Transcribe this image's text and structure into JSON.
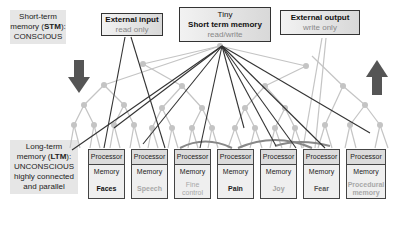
{
  "stm_label": {
    "line1": "Short-term",
    "line2a": "memory (",
    "line2b": "STM",
    "line2c": "):",
    "line3": "CONSCIOUS"
  },
  "ltm_label": {
    "line1": "Long-term",
    "line2a": "memory (",
    "line2b": "LTM",
    "line2c": "):",
    "line3": "UNCONSCIOUS",
    "line4": "highly connected",
    "line5": "and parallel"
  },
  "external_input": {
    "title": "External input",
    "subtitle": "read only"
  },
  "short_term_memory": {
    "title1": "Tiny",
    "title2": "Short term memory",
    "subtitle": "read/write"
  },
  "external_output": {
    "title": "External output",
    "subtitle": "write only"
  },
  "modules": [
    {
      "processor": "Processor",
      "memory": "Memory",
      "name": "Faces",
      "color": "#111111"
    },
    {
      "processor": "Processor",
      "memory": "Memory",
      "name": "Speech",
      "color": "#a8a8a8"
    },
    {
      "processor": "Processor",
      "memory": "Memory",
      "name": "Fine control",
      "color": "#a8a8a8"
    },
    {
      "processor": "Processor",
      "memory": "Memory",
      "name": "Pain",
      "color": "#222222"
    },
    {
      "processor": "Processor",
      "memory": "Memory",
      "name": "Joy",
      "color": "#a0a0a0"
    },
    {
      "processor": "Processor",
      "memory": "Memory",
      "name": "Fear",
      "color": "#555555"
    },
    {
      "processor": "Processor",
      "memory": "Memory",
      "name": "Procedural memory",
      "color": "#a8a8a8"
    }
  ],
  "colors": {
    "arrow": "#555555",
    "tree": "#c4c4c4",
    "lines": "#333333"
  }
}
